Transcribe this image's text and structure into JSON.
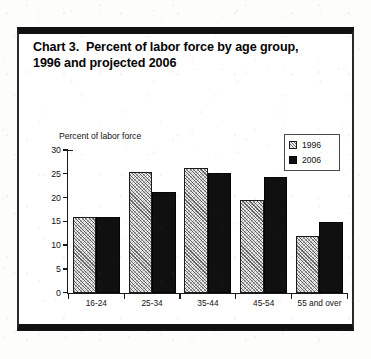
{
  "document": {
    "title_line1": "Chart 3.  Percent of labor force by age group,",
    "title_line2": "1996 and projected 2006"
  },
  "legend": {
    "items": [
      {
        "label": "1996",
        "swatch": "hatched-swatch-icon"
      },
      {
        "label": "2006",
        "swatch": "solid-black-swatch-icon"
      }
    ]
  },
  "chart_data": {
    "type": "bar",
    "title": "Chart 3.  Percent of labor force by age group, 1996 and projected 2006",
    "subtitle": "",
    "xlabel": "",
    "ylabel": "Percent of labor force",
    "categories": [
      "16-24",
      "25-34",
      "35-44",
      "45-54",
      "55 and over"
    ],
    "series": [
      {
        "name": "1996",
        "values": [
          16.0,
          25.3,
          26.3,
          19.5,
          12.0
        ]
      },
      {
        "name": "2006",
        "values": [
          15.9,
          21.2,
          25.1,
          24.3,
          14.9
        ]
      }
    ],
    "ylim": [
      0,
      30
    ],
    "ytick_labels": [
      "30",
      "25",
      "20",
      "15",
      "10",
      "5",
      "0"
    ],
    "ytick_values": [
      30,
      25,
      20,
      15,
      10,
      5,
      0
    ],
    "grid": false,
    "legend_position": "top-right",
    "colors": {
      "series_1996": "#e9e9e9",
      "series_2006": "#101010",
      "axis": "#1a1a1a"
    }
  }
}
